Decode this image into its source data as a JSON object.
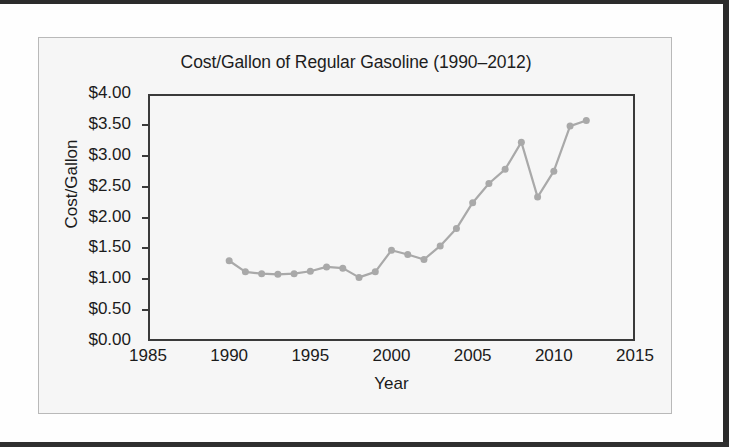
{
  "chart_data": {
    "type": "line",
    "title": "Cost/Gallon of Regular Gasoline (1990–2012)",
    "xlabel": "Year",
    "ylabel": "Cost/Gallon",
    "xlim": [
      1985,
      2015
    ],
    "ylim": [
      0,
      4
    ],
    "grid": false,
    "legend": false,
    "line_color": "#a9a9a9",
    "marker_color": "#a9a9a9",
    "axis_color": "#3a3a3a",
    "x_ticks": [
      "1985",
      "1990",
      "1995",
      "2000",
      "2005",
      "2010",
      "2015"
    ],
    "x_tick_values": [
      1985,
      1990,
      1995,
      2000,
      2005,
      2010,
      2015
    ],
    "y_ticks": [
      "$0.00",
      "$0.50",
      "$1.00",
      "$1.50",
      "$2.00",
      "$2.50",
      "$3.00",
      "$3.50",
      "$4.00"
    ],
    "y_tick_values": [
      0,
      0.5,
      1,
      1.5,
      2,
      2.5,
      3,
      3.5,
      4
    ],
    "x": [
      1990,
      1991,
      1992,
      1993,
      1994,
      1995,
      1996,
      1997,
      1998,
      1999,
      2000,
      2001,
      2002,
      2003,
      2004,
      2005,
      2006,
      2007,
      2008,
      2009,
      2010,
      2011,
      2012
    ],
    "values": [
      1.3,
      1.12,
      1.09,
      1.08,
      1.09,
      1.13,
      1.2,
      1.18,
      1.03,
      1.12,
      1.47,
      1.4,
      1.32,
      1.54,
      1.82,
      2.24,
      2.55,
      2.78,
      3.22,
      2.33,
      2.75,
      3.48,
      3.57
    ],
    "series": [
      {
        "name": "Cost/Gallon",
        "values": [
          1.3,
          1.12,
          1.09,
          1.08,
          1.09,
          1.13,
          1.2,
          1.18,
          1.03,
          1.12,
          1.47,
          1.4,
          1.32,
          1.54,
          1.82,
          2.24,
          2.55,
          2.78,
          3.22,
          2.33,
          2.75,
          3.48,
          3.57
        ]
      }
    ]
  }
}
